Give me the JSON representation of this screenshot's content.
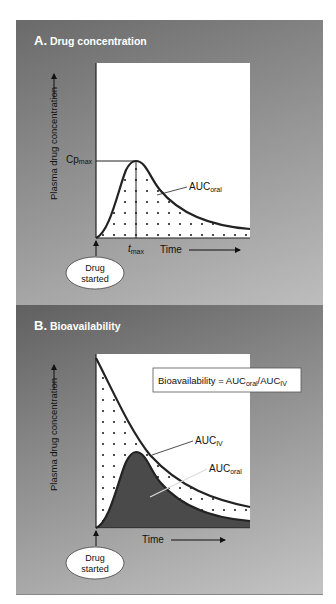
{
  "panels": [
    {
      "letter": "A.",
      "title": "Drug concentration",
      "y_axis_label": "Plasma drug concentration",
      "x_axis_label": "Time",
      "cpmax_label": "Cp",
      "cpmax_sub": "max",
      "tmax_label": "t",
      "tmax_sub": "max",
      "auc_label": "AUC",
      "auc_sub": "oral",
      "start_line1": "Drug",
      "start_line2": "started"
    },
    {
      "letter": "B.",
      "title": "Bioavailability",
      "y_axis_label": "Plasma drug concentration",
      "x_axis_label": "Time",
      "formula_prefix": "Bioavailability = AUC",
      "formula_sub1": "oral",
      "formula_mid": "/AUC",
      "formula_sub2": "IV",
      "auc_iv_label": "AUC",
      "auc_iv_sub": "IV",
      "auc_oral_label": "AUC",
      "auc_oral_sub": "oral",
      "start_line1": "Drug",
      "start_line2": "started"
    }
  ],
  "colors": {
    "panel_dark": "#6a6a6a",
    "panel_light": "#c0c0c0",
    "plot_bg": "#ffffff",
    "curve": "#222222",
    "oral_fill_b": "#4a4a4a"
  }
}
